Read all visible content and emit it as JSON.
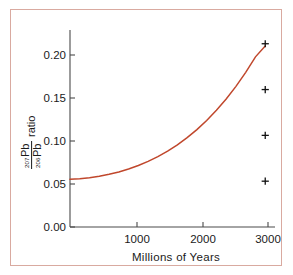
{
  "figure": {
    "name": "lead-isotope-ratio-growth-curve",
    "border_color": "#d9aaa0",
    "background_color": "#ffffff"
  },
  "chart_data": {
    "type": "line",
    "title": "",
    "subtitle": "",
    "xlabel": "Millions of Years",
    "ylabel": "207Pb/206Pb ratio",
    "ylabel_parts": {
      "numerator_sup": "207",
      "numerator_base": "Pb",
      "denominator_sup": "206",
      "denominator_base": "Pb",
      "suffix": "ratio"
    },
    "xlim": [
      0,
      3150
    ],
    "ylim": [
      0.0,
      0.215
    ],
    "xticks": [
      1000,
      2000,
      3000
    ],
    "xtick_labels": [
      "1000",
      "2000",
      "3000"
    ],
    "yticks": [
      0.0,
      0.05,
      0.1,
      0.15,
      0.2
    ],
    "ytick_labels": [
      "0.00",
      "0.05",
      "0.10",
      "0.15",
      "0.20"
    ],
    "grid": false,
    "legend": "none",
    "series": [
      {
        "name": "growth curve",
        "type": "line",
        "color": "#c0472c",
        "x": [
          0,
          150,
          300,
          450,
          600,
          750,
          900,
          1050,
          1200,
          1350,
          1500,
          1650,
          1800,
          1950,
          2100,
          2250,
          2400,
          2550,
          2700,
          2850,
          3000
        ],
        "y": [
          0.052,
          0.0527,
          0.0538,
          0.0554,
          0.0575,
          0.0601,
          0.0633,
          0.0671,
          0.0716,
          0.0768,
          0.0828,
          0.0897,
          0.0975,
          0.1063,
          0.1162,
          0.1273,
          0.1397,
          0.1535,
          0.1688,
          0.1857,
          0.1975
        ]
      },
      {
        "name": "measured samples",
        "type": "scatter",
        "marker": "plus",
        "color": "#111111",
        "x": [
          3000,
          3000,
          3000,
          3000
        ],
        "y": [
          0.2,
          0.15,
          0.1,
          0.05
        ]
      }
    ],
    "annotations": []
  }
}
